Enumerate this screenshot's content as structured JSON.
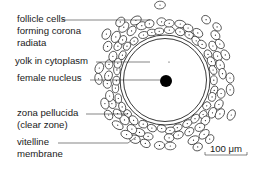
{
  "figure": {
    "background": "#ffffff",
    "ink": "#1a1a1a"
  },
  "ovum": {
    "center": [
      165,
      80
    ],
    "outer_zona_radius": 45,
    "vitelline_radius": 41.5,
    "nucleus_radius": 6,
    "nucleus_center": [
      166,
      81
    ],
    "corona_inner_radius": 46,
    "corona_outer_radius": 70
  },
  "labels": [
    {
      "id": "follicle-cells",
      "lines": [
        "follicle cells",
        "forming corona",
        "radiata"
      ],
      "x": 17,
      "y": 22,
      "line_gap": 12,
      "leader": [
        [
          62,
          20
        ],
        [
          150,
          20
        ]
      ]
    },
    {
      "id": "yolk",
      "lines": [
        "yolk in cytoplasm"
      ],
      "x": 15,
      "y": 64,
      "line_gap": 12,
      "leader": [
        [
          96,
          62
        ],
        [
          150,
          62
        ]
      ]
    },
    {
      "id": "female-nucleus",
      "lines": [
        "female nucleus"
      ],
      "x": 17,
      "y": 81,
      "line_gap": 12,
      "leader": [
        [
          90,
          80
        ],
        [
          160,
          80
        ]
      ]
    },
    {
      "id": "zona-pellucida",
      "lines": [
        "zona pellucida",
        "(clear zone)"
      ],
      "x": 17,
      "y": 116,
      "line_gap": 12,
      "leader": [
        [
          86,
          114
        ],
        [
          128,
          114
        ]
      ]
    },
    {
      "id": "vitelline-membrane",
      "lines": [
        "vitelline",
        "membrane"
      ],
      "x": 17,
      "y": 145,
      "line_gap": 12,
      "leader": [
        [
          58,
          143
        ],
        [
          128,
          143
        ],
        [
          136,
          137
        ]
      ]
    }
  ],
  "scale_bar": {
    "label": "100 μm",
    "x1": 205,
    "x2": 247,
    "y": 155
  }
}
